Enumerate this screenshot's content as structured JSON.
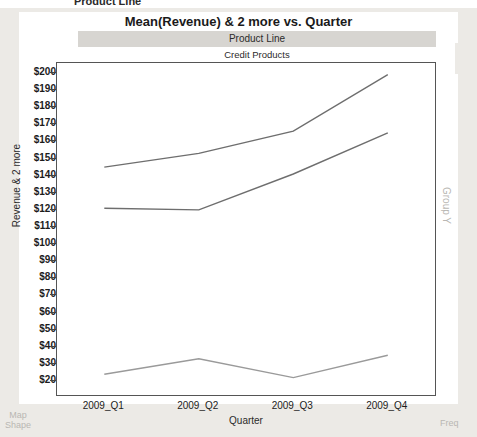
{
  "window": {
    "cropped_top_label": "Product Line",
    "left_dock_label_line1": "Map",
    "left_dock_label_line2": "Shape",
    "right_dock_label": "Freq",
    "group_label": "Group Y"
  },
  "header": {
    "title": "Mean(Revenue) & 2 more vs. Quarter",
    "panel_band": "Product Line",
    "panel_value": "Credit Products"
  },
  "chart_data": {
    "type": "line",
    "title": "Mean(Revenue) & 2 more vs. Quarter",
    "subtitle": "Credit Products",
    "panel_variable": "Product Line",
    "xlabel": "Quarter",
    "ylabel": "Revenue & 2 more",
    "categories": [
      "2009_Q1",
      "2009_Q2",
      "2009_Q3",
      "2009_Q4"
    ],
    "ylim": [
      20,
      200
    ],
    "ytick_step": 10,
    "ytick_prefix": "$",
    "ytick_labels": [
      "$200",
      "$190",
      "$180",
      "$170",
      "$160",
      "$150",
      "$140",
      "$130",
      "$120",
      "$110",
      "$100",
      "$90",
      "$80",
      "$70",
      "$60",
      "$50",
      "$40",
      "$30",
      "$20"
    ],
    "ytick_values": [
      200,
      190,
      180,
      170,
      160,
      150,
      140,
      130,
      120,
      110,
      100,
      90,
      80,
      70,
      60,
      50,
      40,
      30,
      20
    ],
    "grid": false,
    "legend": "none",
    "series": [
      {
        "name": "Series 1",
        "color": "#6e6e6e",
        "values": [
          145,
          153,
          166,
          199
        ]
      },
      {
        "name": "Series 2",
        "color": "#6e6e6e",
        "values": [
          121,
          120,
          141,
          165
        ]
      },
      {
        "name": "Series 3",
        "color": "#9a9a9a",
        "values": [
          24,
          33,
          22,
          35
        ]
      }
    ]
  },
  "colors": {
    "plot_border": "#555555",
    "band_background": "#d7d5d1",
    "chrome": "#eceae6",
    "line": "#6e6e6e"
  }
}
